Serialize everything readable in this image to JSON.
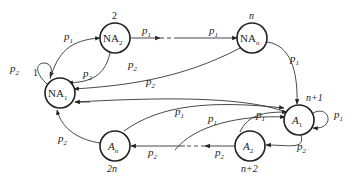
{
  "diagram": {
    "type": "state-transition",
    "nodes": [
      {
        "id": "NA1",
        "base": "NA",
        "sub": "1",
        "index": "1",
        "italic": false
      },
      {
        "id": "NA2",
        "base": "NA",
        "sub": "2",
        "index": "2",
        "italic": false
      },
      {
        "id": "NAn",
        "base": "NA",
        "sub": "n",
        "index": "n",
        "italic": false
      },
      {
        "id": "A1",
        "base": "A",
        "sub": "1",
        "index": "n+1",
        "italic": true
      },
      {
        "id": "A2",
        "base": "A",
        "sub": "2",
        "index": "n+2",
        "italic": true
      },
      {
        "id": "An",
        "base": "A",
        "sub": "n",
        "index": "2n",
        "italic": true
      }
    ],
    "edges": [
      {
        "from": "NA1",
        "to": "NA1",
        "label": "p",
        "sub": "2"
      },
      {
        "from": "NA1",
        "to": "NA2",
        "label": "p",
        "sub": "1"
      },
      {
        "from": "NA2",
        "to": "NAn",
        "label1": "p",
        "sub1": "1",
        "label2": "p",
        "sub2": "1",
        "dashed": true
      },
      {
        "from": "NA2",
        "to": "NA1",
        "label": "p",
        "sub": "2"
      },
      {
        "from": "NAn",
        "to": "NA1",
        "label": "p",
        "sub": "2"
      },
      {
        "from": "NAn",
        "to": "A1",
        "label": "p",
        "sub": "1"
      },
      {
        "from": "A1",
        "to": "A1",
        "label": "p",
        "sub": "1"
      },
      {
        "from": "A1",
        "to": "A2",
        "label": "p",
        "sub": "2"
      },
      {
        "from": "A2",
        "to": "A1",
        "label": "p",
        "sub": "1"
      },
      {
        "from": "A2",
        "to": "An",
        "label1": "p",
        "sub1": "2",
        "label2": "p",
        "sub2": "2",
        "dashed": true
      },
      {
        "from": "An",
        "to": "NA1",
        "label": "p",
        "sub": "2"
      },
      {
        "from": "An",
        "to": "A1",
        "label": "p",
        "sub": "1"
      },
      {
        "from": "A1",
        "to": "NA1",
        "label": "p",
        "sub": "2"
      },
      {
        "from": "NA1",
        "to": "A1",
        "label": "p",
        "sub": "1"
      }
    ]
  }
}
